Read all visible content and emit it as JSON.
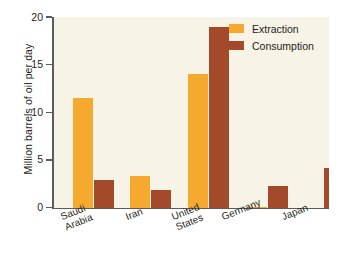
{
  "chart_data": {
    "type": "bar",
    "title": "",
    "subtitle": "",
    "xlabel": "",
    "ylabel": "Million barrels of oil per day",
    "ylim": [
      0,
      20
    ],
    "yticks": [
      0,
      5,
      10,
      15,
      20
    ],
    "ytick_labels": [
      "0",
      "5",
      "10",
      "15",
      "20"
    ],
    "grid": true,
    "grid_axis": "y",
    "legend_position": "top-right",
    "categories": [
      "Saudi\nArabia",
      "Iran",
      "United\nStates",
      "Germany",
      "Japan"
    ],
    "category_labels_flat": [
      "Saudi Arabia",
      "Iran",
      "United States",
      "Germany",
      "Japan"
    ],
    "series": [
      {
        "name": "Extraction",
        "color": "#f5a92f",
        "values": [
          11.5,
          3.3,
          14.0,
          0.1,
          0.0
        ]
      },
      {
        "name": "Consumption",
        "color": "#a24a29",
        "values": [
          2.9,
          1.8,
          19.0,
          2.3,
          4.2
        ]
      }
    ]
  },
  "legend": {
    "items": [
      {
        "label": "Extraction",
        "color": "#f5a92f"
      },
      {
        "label": "Consumption",
        "color": "#a24a29"
      }
    ]
  },
  "colors": {
    "extraction": "#f5a92f",
    "consumption": "#a24a29",
    "plot_background": "#f8f3e7",
    "page_background": "#ffffff",
    "axis": "#5d5b58",
    "gridline": "#e9e2d2",
    "text": "#231f20"
  }
}
